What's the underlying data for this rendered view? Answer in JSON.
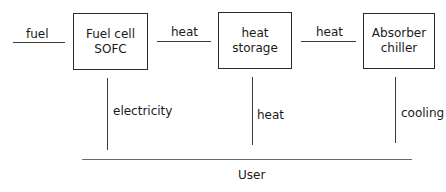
{
  "diagram": {
    "type": "block-flow",
    "inputs": [
      {
        "label": "fuel"
      }
    ],
    "nodes": [
      {
        "id": "fuel_cell",
        "lines": [
          "Fuel cell",
          "SOFC"
        ]
      },
      {
        "id": "heat_storage",
        "lines": [
          "heat storage"
        ]
      },
      {
        "id": "absorber_chiller",
        "lines": [
          "Absorber",
          "chiller"
        ]
      }
    ],
    "horizontal_flows": [
      {
        "from": "input",
        "to": "fuel_cell",
        "label": "fuel"
      },
      {
        "from": "fuel_cell",
        "to": "heat_storage",
        "label": "heat"
      },
      {
        "from": "heat_storage",
        "to": "absorber_chiller",
        "label": "heat"
      }
    ],
    "vertical_flows": [
      {
        "from": "fuel_cell",
        "to": "user",
        "label": "electricity"
      },
      {
        "from": "heat_storage",
        "to": "user",
        "label": "heat"
      },
      {
        "from": "absorber_chiller",
        "to": "user",
        "label": "cooling"
      }
    ],
    "sink": {
      "label": "User"
    }
  }
}
